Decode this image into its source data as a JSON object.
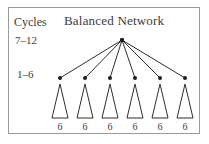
{
  "figure": {
    "title": "Balanced Network",
    "axis_label": "Cycles",
    "level_labels": {
      "upper": "7–12",
      "lower": "1–6"
    },
    "border_color": "#9a9a9a",
    "line_color": "#2e2e2e",
    "node_color": "#1d1d1d",
    "text_color": "#3b3b3b"
  },
  "diagram_data": {
    "type": "tree",
    "root": {
      "name": "root-node",
      "x": 122,
      "y": 40
    },
    "children": [
      {
        "name": "child-node-1",
        "x": 60,
        "y": 78,
        "subtree_label": "6"
      },
      {
        "name": "child-node-2",
        "x": 85,
        "y": 78,
        "subtree_label": "6"
      },
      {
        "name": "child-node-3",
        "x": 110,
        "y": 78,
        "subtree_label": "6"
      },
      {
        "name": "child-node-4",
        "x": 135,
        "y": 78,
        "subtree_label": "6"
      },
      {
        "name": "child-node-5",
        "x": 160,
        "y": 78,
        "subtree_label": "6"
      },
      {
        "name": "child-node-6",
        "x": 185,
        "y": 78,
        "subtree_label": "6"
      }
    ],
    "subtree_labels": [
      "6",
      "6",
      "6",
      "6",
      "6",
      "6"
    ],
    "branching_factor": 6,
    "triangle": {
      "apex_offset_y": 6,
      "base_y": 118,
      "half_width": 8
    },
    "leaf_label_y": 130
  }
}
